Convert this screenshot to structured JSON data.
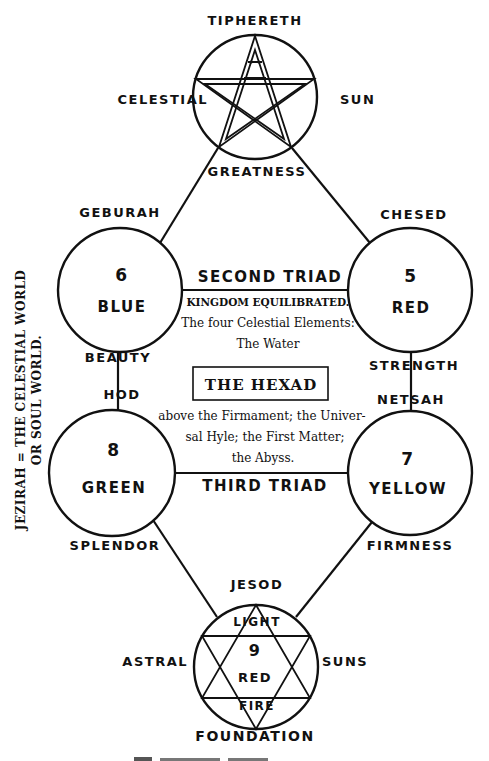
{
  "diagram": {
    "vertical_caption": {
      "line1": "JEZIRAH = THE CELESTIAL WORLD",
      "line2": "OR SOUL WORLD."
    },
    "top_node": {
      "label_top": "TIPHERETH",
      "label_left": "CELESTIAL",
      "label_right": "SUN",
      "label_bottom": "GREATNESS",
      "symbol": "pentagram"
    },
    "nodes": [
      {
        "id": "geburah",
        "number": "6",
        "color": "BLUE",
        "label_top": "GEBURAH",
        "label_bottom": "BEAUTY"
      },
      {
        "id": "chesed",
        "number": "5",
        "color": "RED",
        "label_top": "CHESED",
        "label_bottom": "STRENGTH"
      },
      {
        "id": "hod",
        "number": "8",
        "color": "GREEN",
        "label_top": "HOD",
        "label_bottom": "SPLENDOR"
      },
      {
        "id": "netsah",
        "number": "7",
        "color": "YELLOW",
        "label_top": "NETSAH",
        "label_bottom": "FIRMNESS"
      }
    ],
    "bottom_node": {
      "label_top": "JESOD",
      "label_left": "ASTRAL",
      "label_right": "SUNS",
      "label_bottom": "FOUNDATION",
      "inner_top": "LIGHT",
      "number": "9",
      "color": "RED",
      "inner_bottom": "FIRE",
      "symbol": "hexagram"
    },
    "connectors": {
      "second_triad": "SECOND TRIAD",
      "third_triad": "THIRD TRIAD"
    },
    "center_text": {
      "kingdom": "KINGDOM EQUILIBRATED.",
      "line1": "The four Celestial Elements:",
      "line2": "The Water",
      "title": "THE HEXAD",
      "line3": "above the Firmament; the Univer-",
      "line4": "sal Hyle; the First Matter;",
      "line5": "the Abyss."
    }
  }
}
